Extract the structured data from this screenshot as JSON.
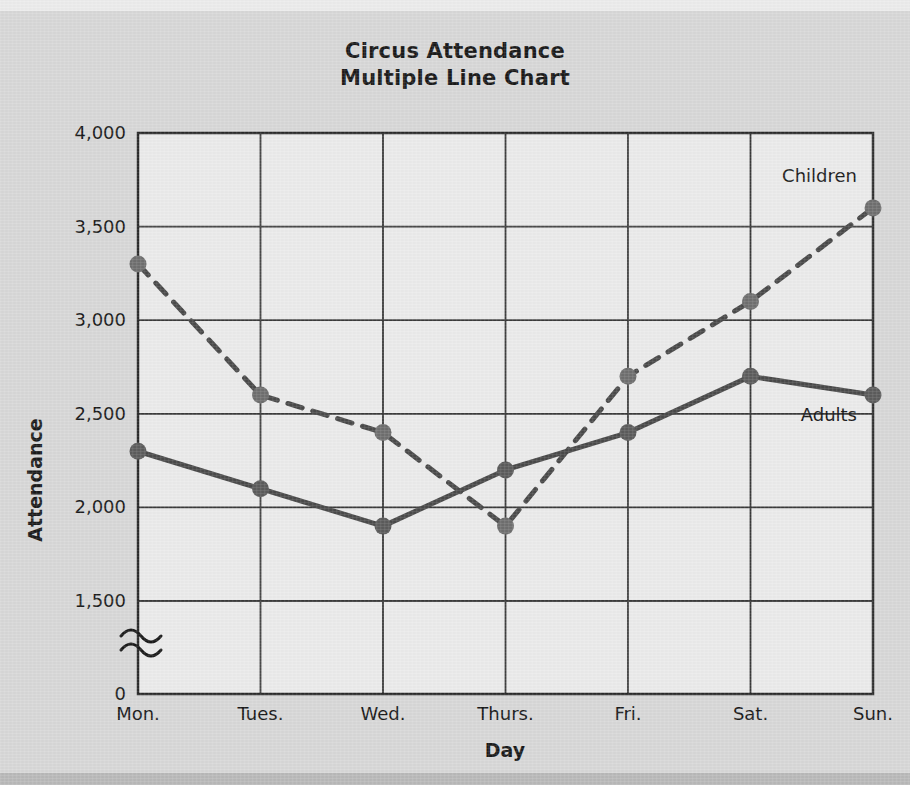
{
  "chart_data": {
    "type": "line",
    "title": "Circus Attendance",
    "subtitle": "Multiple Line Chart",
    "xlabel": "Day",
    "ylabel": "Attendance",
    "categories": [
      "Mon.",
      "Tues.",
      "Wed.",
      "Thurs.",
      "Fri.",
      "Sat.",
      "Sun."
    ],
    "ytick_labels": [
      "0",
      "1,500",
      "2,000",
      "2,500",
      "3,000",
      "3,500",
      "4,000"
    ],
    "ytick_values": [
      0,
      1500,
      2000,
      2500,
      3000,
      3500,
      4000
    ],
    "ylim": [
      0,
      4000
    ],
    "y_axis_break": true,
    "y_axis_break_note": "axis break squiggle between 0 and 1,500",
    "grid": true,
    "legend": "inline-labels",
    "series": [
      {
        "name": "Children",
        "style": "dashed",
        "color": "#4a4a4a",
        "marker_color": "#6f6f6f",
        "label_position": "above-right-end",
        "values": [
          3300,
          2600,
          2400,
          1900,
          2700,
          3100,
          3600
        ]
      },
      {
        "name": "Adults",
        "style": "solid",
        "color": "#4a4a4a",
        "marker_color": "#5c5c5c",
        "label_position": "below-right-end",
        "values": [
          2300,
          2100,
          1900,
          2200,
          2400,
          2700,
          2600
        ]
      }
    ],
    "colors": {
      "page_background": "#d8d8d8",
      "plot_background": "#ebebeb",
      "axis": "#2a2a2a",
      "grid": "#3a3a3a",
      "text": "#1a1a1a"
    }
  }
}
